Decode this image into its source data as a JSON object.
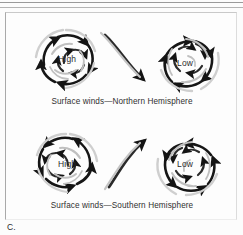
{
  "figure": {
    "letter": "C.",
    "panels": [
      {
        "id": "northern-hemisphere",
        "caption": "Surface winds—Northern Hemisphere",
        "systems": [
          {
            "id": "high",
            "label": "High",
            "rotation": "clockwise",
            "flow": "outward-diverging"
          },
          {
            "id": "low",
            "label": "Low",
            "rotation": "counterclockwise",
            "flow": "inward-converging"
          }
        ],
        "connector": {
          "from": "high",
          "to": "low",
          "direction": "down-right"
        }
      },
      {
        "id": "southern-hemisphere",
        "caption": "Surface winds—Southern Hemisphere",
        "systems": [
          {
            "id": "high",
            "label": "High",
            "rotation": "counterclockwise",
            "flow": "outward-diverging"
          },
          {
            "id": "low",
            "label": "Low",
            "rotation": "clockwise",
            "flow": "inward-converging"
          }
        ],
        "connector": {
          "from": "high",
          "to": "low",
          "direction": "up-right"
        }
      }
    ],
    "colors": {
      "arrow_dark": "#141414",
      "arrow_mid": "#5d5d5d",
      "arrow_light": "#b9b9b9",
      "background": "#fdfdfd",
      "frame": "#a9a9a9",
      "text": "#2a2a2a"
    }
  }
}
